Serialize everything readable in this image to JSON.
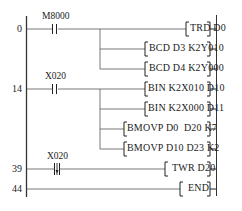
{
  "diagram": {
    "type": "ladder",
    "colors": {
      "line": "#444444",
      "background": "#ffffff"
    },
    "rungs": [
      {
        "step": "0",
        "contact": {
          "label": "M8000",
          "type": "normally-open"
        },
        "instructions": [
          "TRD D0",
          "BCD D3 K2Y010",
          "BCD D4 K2Y000"
        ]
      },
      {
        "step": "14",
        "contact": {
          "label": "X020",
          "type": "normally-open"
        },
        "instructions": [
          "BIN K2X010 D10",
          "BIN K2X000 D11",
          "BMOVP D0  D20 K7",
          "BMOVP D10 D23 K2"
        ]
      },
      {
        "step": "39",
        "contact": {
          "label": "X020",
          "type": "falling-edge"
        },
        "instructions": [
          "TWR D20"
        ]
      },
      {
        "step": "44",
        "contact": null,
        "instructions": [
          "END"
        ]
      }
    ]
  }
}
